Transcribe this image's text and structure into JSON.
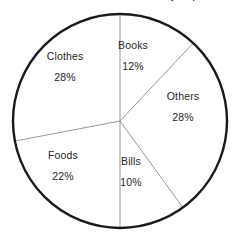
{
  "chart_data": {
    "type": "pie",
    "title": "Monthly expenses",
    "title_clipped": true,
    "xlabel": "",
    "ylabel": "",
    "legend_position": "none",
    "labels_inside_slices": true,
    "start_angle_deg": 0,
    "direction": "clockwise",
    "unit": "%",
    "total": 100,
    "categories": [
      "Books",
      "Others",
      "Bills",
      "Foods",
      "Clothes"
    ],
    "values": [
      12,
      28,
      10,
      22,
      28
    ],
    "slices": [
      {
        "label": "Books",
        "value": 12,
        "pct_text": "12%",
        "sweep_deg": 43.2,
        "start_deg": 0.0,
        "end_deg": 43.2
      },
      {
        "label": "Others",
        "value": 28,
        "pct_text": "28%",
        "sweep_deg": 100.8,
        "start_deg": 43.2,
        "end_deg": 144.0
      },
      {
        "label": "Bills",
        "value": 10,
        "pct_text": "10%",
        "sweep_deg": 36.0,
        "start_deg": 144.0,
        "end_deg": 180.0
      },
      {
        "label": "Foods",
        "value": 22,
        "pct_text": "22%",
        "sweep_deg": 79.2,
        "start_deg": 180.0,
        "end_deg": 259.2
      },
      {
        "label": "Clothes",
        "value": 28,
        "pct_text": "28%",
        "sweep_deg": 100.8,
        "start_deg": 259.2,
        "end_deg": 360.0
      }
    ],
    "style": {
      "slice_fill": "#ffffff",
      "outline_color": "#1a1a1a",
      "divider_color": "#8c8c8c",
      "text_color": "#262626",
      "background": "#ffffff"
    },
    "geometry": {
      "cx": 120,
      "cy": 121,
      "r": 107
    }
  }
}
